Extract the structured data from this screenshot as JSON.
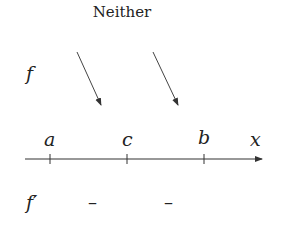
{
  "title": "Neither",
  "f_label": "f",
  "fprime_label": "f′",
  "axis": {
    "variable": "x",
    "points": [
      "a",
      "c",
      "b"
    ]
  },
  "f_behavior": [
    "decreasing",
    "decreasing"
  ],
  "fprime_signs": [
    "–",
    "–"
  ]
}
